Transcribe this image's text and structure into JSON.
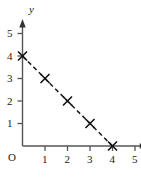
{
  "chart_data": {
    "type": "line",
    "title": "",
    "subtitle": "",
    "xlabel": "",
    "ylabel": "y",
    "origin_label": "O",
    "x": [
      0,
      1,
      2,
      3,
      4
    ],
    "values": [
      4,
      3,
      2,
      1,
      0
    ],
    "series": [
      {
        "name": "",
        "x": [
          0,
          1,
          2,
          3,
          4
        ],
        "values": [
          4,
          3,
          2,
          1,
          0
        ]
      }
    ],
    "xlim": [
      0,
      5.5
    ],
    "ylim": [
      0,
      5.6
    ],
    "xticks": [
      1,
      2,
      3,
      4,
      5
    ],
    "yticks": [
      1,
      2,
      3,
      4,
      5
    ],
    "xtick_labels": [
      "1",
      "2",
      "3",
      "4",
      "5"
    ],
    "ytick_labels": [
      "1",
      "2",
      "3",
      "4",
      "5"
    ],
    "grid": false,
    "legend": false,
    "legend_position": "none",
    "line_style": "dashed",
    "marker": "x",
    "line_color": "#1a1a1a",
    "marker_color": "#1a1a1a",
    "axis_color": "#4a4a4a",
    "background": "#ffffff",
    "x_axis_arrow": true,
    "y_axis_arrow": true,
    "annotations": []
  },
  "axes": {
    "y_name": "y",
    "origin": "O"
  },
  "ticks": {
    "x": [
      {
        "label": "1",
        "value": 1
      },
      {
        "label": "2",
        "value": 2
      },
      {
        "label": "3",
        "value": 3
      },
      {
        "label": "4",
        "value": 4
      },
      {
        "label": "5",
        "value": 5
      }
    ],
    "y": [
      {
        "label": "1",
        "value": 1
      },
      {
        "label": "2",
        "value": 2
      },
      {
        "label": "3",
        "value": 3
      },
      {
        "label": "4",
        "value": 4
      },
      {
        "label": "5",
        "value": 5
      }
    ]
  }
}
